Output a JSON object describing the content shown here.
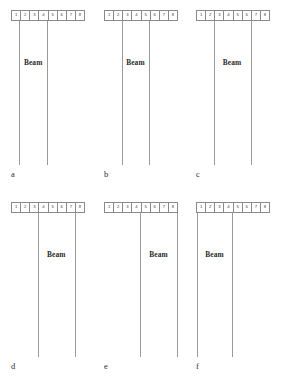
{
  "figure": {
    "cell_labels": [
      "1",
      "2",
      "3",
      "4",
      "5",
      "6",
      "7",
      "8"
    ],
    "beam_text": "Beam",
    "line_color": "#9a9a9a",
    "cell_border_color": "#8a8a8a",
    "text_color": "#2b2b2b",
    "background": "#ffffff",
    "panels": [
      {
        "letter": "a",
        "left": 11,
        "top": 10,
        "beam_height": 144,
        "left_line_cell": 0.9,
        "right_line_cell": 3.9,
        "beam_label_y": 48,
        "letter_y": 160,
        "cells": [
          "1",
          "2",
          "3",
          "4",
          "5",
          "6",
          "7",
          "8"
        ],
        "beam_text": "Beam"
      },
      {
        "letter": "b",
        "left": 104,
        "top": 10,
        "beam_height": 144,
        "left_line_cell": 1.9,
        "right_line_cell": 4.9,
        "beam_label_y": 48,
        "letter_y": 160,
        "cells": [
          "1",
          "2",
          "3",
          "4",
          "5",
          "6",
          "7",
          "8"
        ],
        "beam_text": "Beam"
      },
      {
        "letter": "c",
        "left": 196,
        "top": 10,
        "beam_height": 144,
        "left_line_cell": 1.9,
        "right_line_cell": 5.9,
        "beam_label_y": 48,
        "letter_y": 160,
        "cells": [
          "1",
          "2",
          "3",
          "4",
          "5",
          "6",
          "7",
          "8"
        ],
        "beam_text": "Beam"
      },
      {
        "letter": "d",
        "left": 11,
        "top": 202,
        "beam_height": 144,
        "left_line_cell": 2.9,
        "right_line_cell": 6.9,
        "beam_label_y": 48,
        "letter_y": 160,
        "cells": [
          "1",
          "2",
          "3",
          "4",
          "5",
          "6",
          "7",
          "8"
        ],
        "beam_text": "Beam"
      },
      {
        "letter": "e",
        "left": 104,
        "top": 202,
        "beam_height": 144,
        "left_line_cell": 3.9,
        "right_line_cell": 7.9,
        "beam_label_y": 48,
        "letter_y": 160,
        "cells": [
          "1",
          "2",
          "3",
          "4",
          "5",
          "6",
          "7",
          "8"
        ],
        "beam_text": "Beam"
      },
      {
        "letter": "f",
        "left": 196,
        "top": 202,
        "beam_height": 144,
        "left_line_cell": 0.1,
        "right_line_cell": 3.9,
        "beam_label_y": 48,
        "letter_y": 160,
        "cells": [
          "1",
          "2",
          "3",
          "4",
          "5",
          "6",
          "7",
          "8"
        ],
        "beam_text": "Beam"
      }
    ]
  }
}
